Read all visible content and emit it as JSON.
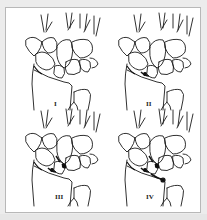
{
  "figure": {
    "title": "",
    "background_color": "#ececec",
    "frame_color": "#ffffff",
    "frame_border_color": "#b8b8b8",
    "line_color": "#1a1a1a"
  },
  "panels": [
    {
      "label": "I",
      "position": "top-left",
      "stage": 1,
      "marks": [
        "radial-styloid"
      ]
    },
    {
      "label": "II",
      "position": "top-right",
      "stage": 2,
      "marks": [
        "radial-styloid",
        "scapholunate"
      ]
    },
    {
      "label": "III",
      "position": "bottom-left",
      "stage": 3,
      "marks": [
        "radial-styloid",
        "scapholunate",
        "lunotriquetral"
      ]
    },
    {
      "label": "IV",
      "position": "bottom-right",
      "stage": 4,
      "marks": [
        "radial-styloid",
        "scapholunate",
        "lunotriquetral",
        "radiolunate"
      ]
    }
  ]
}
